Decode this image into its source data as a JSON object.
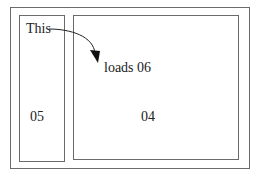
{
  "diagram": {
    "outer_frame": {
      "x": 10,
      "y": 7,
      "w": 240,
      "h": 162
    },
    "boxes": [
      {
        "id": "05",
        "label": "05",
        "x": 19,
        "y": 15,
        "w": 46,
        "h": 147,
        "label_x": 30,
        "label_y": 104
      },
      {
        "id": "04",
        "label": "04",
        "x": 73,
        "y": 15,
        "w": 166,
        "h": 145,
        "label_x": 141,
        "label_y": 104
      }
    ],
    "annotations": [
      {
        "text": "This",
        "x": 26,
        "y": 22
      },
      {
        "text": "loads 06",
        "x": 104,
        "y": 61
      }
    ],
    "arrow": {
      "from": "This",
      "to": "loads 06",
      "path": "M49,29 C70,29 94,36 95,56",
      "head": "91,52 99,51 98,62"
    },
    "colors": {
      "line": "#6a6a6a",
      "text": "#222222",
      "arrow": "#111111",
      "background": "#ffffff"
    }
  }
}
